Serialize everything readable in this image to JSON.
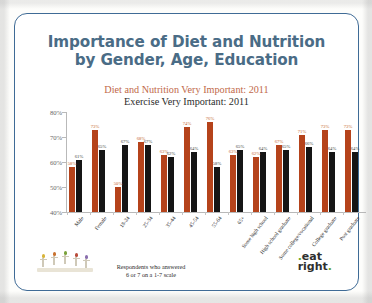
{
  "slide": {
    "title_line1": "Importance of Diet and Nutrition",
    "title_line2": "by Gender, Age, Education",
    "subtitle1": "Diet and Nutrition Very Important: 2011",
    "subtitle2": "Exercise Very Important: 2011",
    "footnote_line1": "Respondents who answered",
    "footnote_line2": "6 or 7 on a 1-7 scale",
    "logo_eat": "eat",
    "logo_right": "right",
    "logo_dot": ".",
    "colors": {
      "title": "#4a6c86",
      "frame": "#3f6b96",
      "series_diet": "#b5431b",
      "series_exercise": "#151515",
      "subtitle1": "#c1694a",
      "subtitle2": "#2b2b2b"
    }
  },
  "chart_data": {
    "type": "bar",
    "title": "Importance of Diet and Nutrition by Gender, Age, Education",
    "xlabel": "",
    "ylabel": "",
    "ylim": [
      40,
      80
    ],
    "yticks": [
      "40%",
      "50%",
      "60%",
      "70%",
      "80%"
    ],
    "ytick_values": [
      40,
      50,
      60,
      70,
      80
    ],
    "grid": false,
    "legend_position": "none",
    "categories": [
      "Male",
      "Female",
      "18-24",
      "25-34",
      "35-44",
      "45-54",
      "55-64",
      "65+",
      "Some high school",
      "High school graduate",
      "Some college/vocational",
      "College graduate",
      "Post graduate"
    ],
    "series": [
      {
        "name": "Diet and Nutrition Very Important: 2011",
        "color": "#b5431b",
        "values": [
          58,
          73,
          50,
          68,
          63,
          74,
          76,
          63,
          62,
          67,
          71,
          73,
          73
        ],
        "labels": [
          "58%",
          "73%",
          "50%",
          "68%",
          "63%",
          "74%",
          "76%",
          "63%",
          "62%",
          "67%",
          "71%",
          "73%",
          "73%"
        ]
      },
      {
        "name": "Exercise Very Important: 2011",
        "color": "#151515",
        "values": [
          61,
          65,
          67,
          67,
          62,
          64,
          58,
          65,
          64,
          65,
          66,
          64,
          64
        ],
        "labels": [
          "61%",
          "65%",
          "67%",
          "67%",
          "62%",
          "64%",
          "58%",
          "65%",
          "64%",
          "65%",
          "66%",
          "64%",
          "64%"
        ]
      }
    ]
  }
}
